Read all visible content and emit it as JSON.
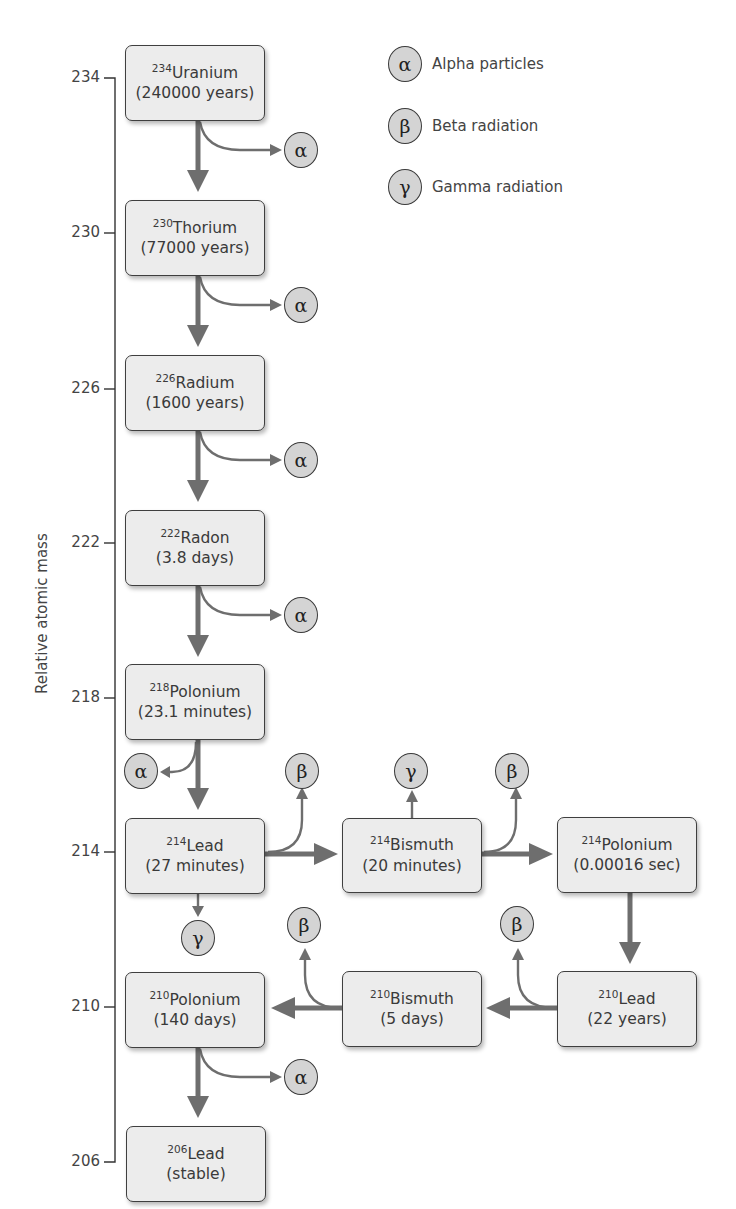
{
  "axis": {
    "title": "Relative atomic mass",
    "ticks": [
      {
        "label": "234",
        "y": 78
      },
      {
        "label": "230",
        "y": 233
      },
      {
        "label": "226",
        "y": 389
      },
      {
        "label": "222",
        "y": 543
      },
      {
        "label": "218",
        "y": 698
      },
      {
        "label": "214",
        "y": 852
      },
      {
        "label": "210",
        "y": 1007
      },
      {
        "label": "206",
        "y": 1162
      }
    ]
  },
  "legend": [
    {
      "symbol": "α",
      "label": "Alpha particles"
    },
    {
      "symbol": "β",
      "label": "Beta radiation"
    },
    {
      "symbol": "γ",
      "label": "Gamma radiation"
    }
  ],
  "nuclides": [
    {
      "id": "u234",
      "mass": "234",
      "element": "Uranium",
      "half_life": "(240000 years)"
    },
    {
      "id": "th230",
      "mass": "230",
      "element": "Thorium",
      "half_life": "(77000 years)"
    },
    {
      "id": "ra226",
      "mass": "226",
      "element": "Radium",
      "half_life": "(1600 years)"
    },
    {
      "id": "rn222",
      "mass": "222",
      "element": "Radon",
      "half_life": "(3.8 days)"
    },
    {
      "id": "po218",
      "mass": "218",
      "element": "Polonium",
      "half_life": "(23.1 minutes)"
    },
    {
      "id": "pb214",
      "mass": "214",
      "element": "Lead",
      "half_life": "(27 minutes)"
    },
    {
      "id": "bi214",
      "mass": "214",
      "element": "Bismuth",
      "half_life": "(20 minutes)"
    },
    {
      "id": "po214",
      "mass": "214",
      "element": "Polonium",
      "half_life": "(0.00016 sec)"
    },
    {
      "id": "pb210",
      "mass": "210",
      "element": "Lead",
      "half_life": "(22 years)"
    },
    {
      "id": "bi210",
      "mass": "210",
      "element": "Bismuth",
      "half_life": "(5 days)"
    },
    {
      "id": "po210",
      "mass": "210",
      "element": "Polonium",
      "half_life": "(140 days)"
    },
    {
      "id": "pb206",
      "mass": "206",
      "element": "Lead",
      "half_life": "(stable)"
    }
  ],
  "emissions": [
    {
      "from": "u234",
      "symbol": "α"
    },
    {
      "from": "th230",
      "symbol": "α"
    },
    {
      "from": "ra226",
      "symbol": "α"
    },
    {
      "from": "rn222",
      "symbol": "α"
    },
    {
      "from": "po218",
      "symbol": "α"
    },
    {
      "from": "pb214",
      "symbol": "β"
    },
    {
      "from": "pb214",
      "symbol": "γ"
    },
    {
      "from": "bi214",
      "symbol": "γ"
    },
    {
      "from": "bi214",
      "symbol": "β"
    },
    {
      "from": "pb210",
      "symbol": "β"
    },
    {
      "from": "bi210",
      "symbol": "β"
    },
    {
      "from": "po210",
      "symbol": "α"
    }
  ],
  "colors": {
    "box_fill": "#ececec",
    "box_border": "#3f3f3f",
    "arrow": "#6e6e6e",
    "particle_fill": "#d4d4d4",
    "text": "#3a3a3a"
  }
}
